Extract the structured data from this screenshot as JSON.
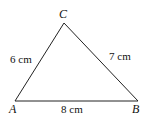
{
  "diagram": {
    "type": "triangle",
    "vertices": {
      "A": {
        "label": "A",
        "x": 15,
        "y": 101
      },
      "B": {
        "label": "B",
        "x": 138,
        "y": 101
      },
      "C": {
        "label": "C",
        "x": 64,
        "y": 23
      }
    },
    "sides": {
      "AC": {
        "label": "6 cm"
      },
      "BC": {
        "label": "7 cm"
      },
      "AB": {
        "label": "8 cm"
      }
    },
    "stroke_color": "#222222"
  }
}
